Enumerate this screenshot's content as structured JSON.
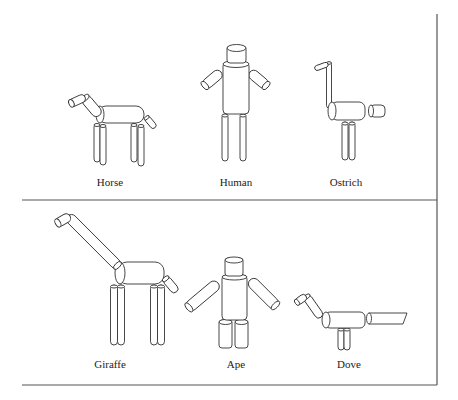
{
  "figure": {
    "type": "stick-figure cylinder models",
    "panels": [
      {
        "row": "top",
        "animals": [
          {
            "name": "Horse",
            "label_x": 110,
            "label_y": 176
          },
          {
            "name": "Human",
            "label_x": 236,
            "label_y": 176
          },
          {
            "name": "Ostrich",
            "label_x": 346,
            "label_y": 176
          }
        ]
      },
      {
        "row": "bottom",
        "animals": [
          {
            "name": "Giraffe",
            "label_x": 110,
            "label_y": 358
          },
          {
            "name": "Ape",
            "label_x": 236,
            "label_y": 358
          },
          {
            "name": "Dove",
            "label_x": 349,
            "label_y": 358
          }
        ]
      }
    ],
    "colors": {
      "background": "#ffffff",
      "stroke": "#333333",
      "rule": "#555555"
    }
  }
}
